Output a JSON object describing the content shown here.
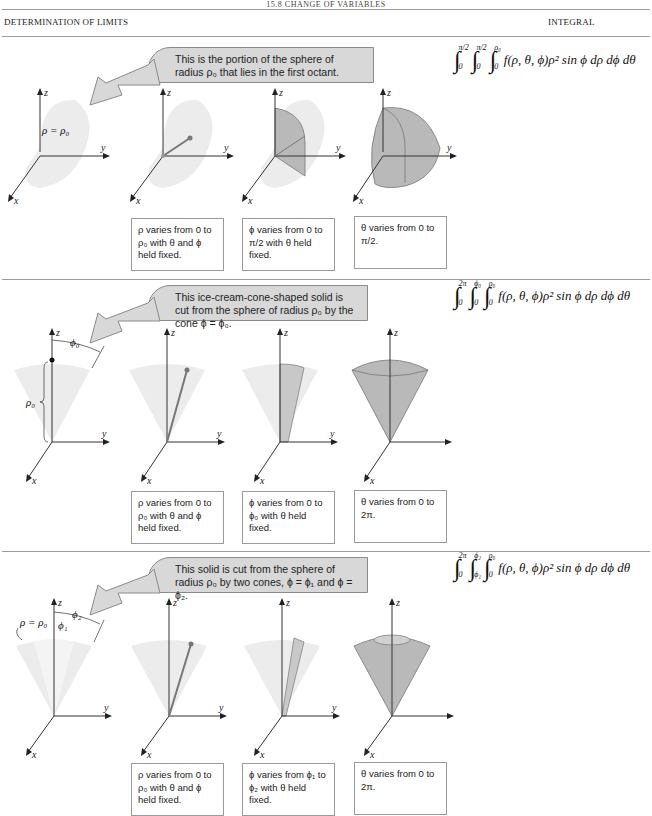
{
  "running_head": "15.8 CHANGE OF VARIABLES",
  "header": {
    "left": "DETERMINATION OF LIMITS",
    "right": "INTEGRAL"
  },
  "rows": [
    {
      "callout": "This is the portion of the sphere of radius ρ₀ that lies in the first octant.",
      "integral": {
        "outer": {
          "upper": "π/2",
          "lower": "0"
        },
        "middle": {
          "upper": "π/2",
          "lower": "0"
        },
        "inner": {
          "upper": "ρ₀",
          "lower": "0"
        },
        "integrand": "f(ρ, θ, ϕ)ρ² sin ϕ dρ dϕ dθ"
      },
      "figure_label": "ρ = ρ₀",
      "steps": [
        "ρ varies from 0 to ρ₀ with θ and ϕ held fixed.",
        "ϕ varies from 0 to π/2 with θ held fixed.",
        "θ varies from 0 to π/2."
      ]
    },
    {
      "callout": "This ice-cream-cone-shaped solid is cut from the sphere of radius ρ₀ by the cone ϕ = ϕ₀.",
      "integral": {
        "outer": {
          "upper": "2π",
          "lower": "0"
        },
        "middle": {
          "upper": "ϕ₀",
          "lower": "0"
        },
        "inner": {
          "upper": "ρ₀",
          "lower": "0"
        },
        "integrand": "f(ρ, θ, ϕ)ρ² sin ϕ dρ dϕ dθ"
      },
      "figure_labels": {
        "angle": "ϕ₀",
        "radius": "ρ₀"
      },
      "steps": [
        "ρ varies from 0 to ρ₀ with θ and ϕ held fixed.",
        "ϕ varies from 0 to ϕ₀ with θ held fixed.",
        "θ varies from 0 to 2π."
      ]
    },
    {
      "callout": "This solid is cut from the sphere of radius ρ₀ by two cones, ϕ = ϕ₁ and ϕ = ϕ₂.",
      "integral": {
        "outer": {
          "upper": "2π",
          "lower": "0"
        },
        "middle": {
          "upper": "ϕ₂",
          "lower": "ϕ₁"
        },
        "inner": {
          "upper": "ρ₀",
          "lower": "0"
        },
        "integrand": "f(ρ, θ, ϕ)ρ² sin ϕ dρ dϕ dθ"
      },
      "figure_labels": {
        "surface": "ρ = ρ₀",
        "angle1": "ϕ₁",
        "angle2": "ϕ₂"
      },
      "steps": [
        "ρ varies from 0 to ρ₀ with θ and ϕ held fixed.",
        "ϕ varies from ϕ₁ to ϕ₂ with θ held fixed.",
        "θ varies from 0 to 2π."
      ]
    }
  ],
  "axes": {
    "x": "x",
    "y": "y",
    "z": "z"
  },
  "colors": {
    "callout_fill": "#d8d8d8",
    "solid_light": "#ececec",
    "solid_dark": "#b9b9b9",
    "rule": "#9a9a9a"
  }
}
